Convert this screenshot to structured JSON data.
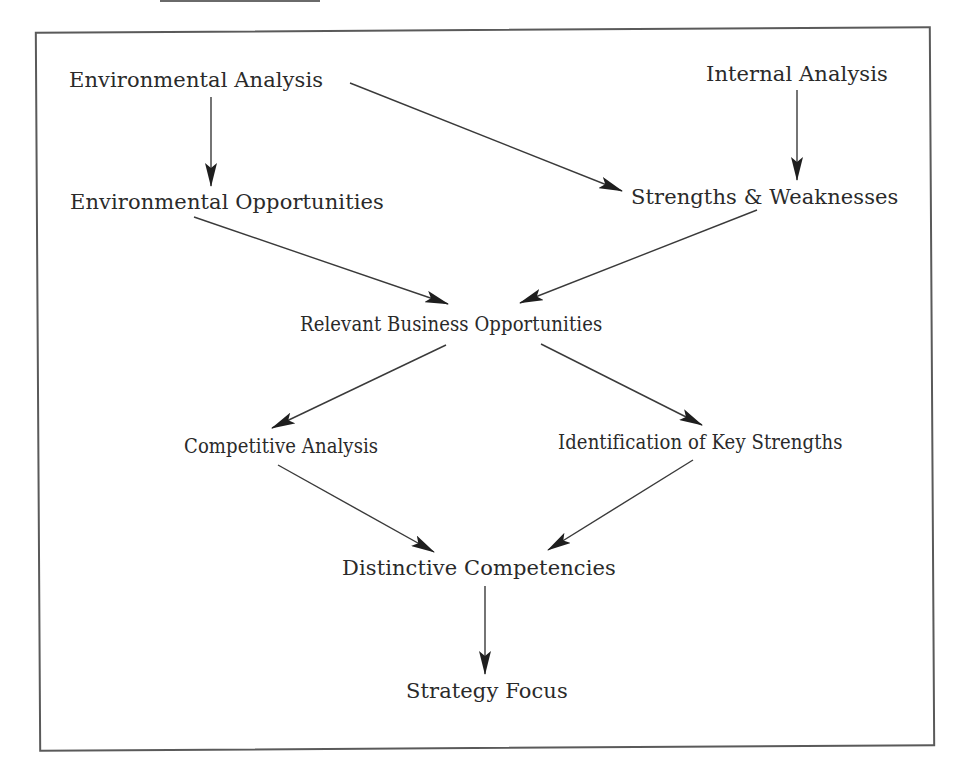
{
  "diagram": {
    "type": "flowchart",
    "colors": {
      "line": "#3a3a3a",
      "arrowhead": "#1e1e1e",
      "text": "#2a2a2a",
      "frame": "#5a5a5a",
      "background": "#ffffff"
    },
    "nodes": [
      {
        "id": "env_analysis",
        "label": "Environmental Analysis"
      },
      {
        "id": "internal_analysis",
        "label": "Internal Analysis"
      },
      {
        "id": "env_opportunities",
        "label": "Environmental Opportunities"
      },
      {
        "id": "strengths_weaknesses",
        "label": "Strengths & Weaknesses"
      },
      {
        "id": "relevant_business_opps",
        "label": "Relevant Business Opportunities"
      },
      {
        "id": "competitive_analysis",
        "label": "Competitive Analysis"
      },
      {
        "id": "key_strengths",
        "label": "Identification of Key Strengths"
      },
      {
        "id": "distinctive_competencies",
        "label": "Distinctive Competencies"
      },
      {
        "id": "strategy_focus",
        "label": "Strategy Focus"
      }
    ],
    "edges": [
      {
        "from": "env_analysis",
        "to": "env_opportunities"
      },
      {
        "from": "env_analysis",
        "to": "strengths_weaknesses"
      },
      {
        "from": "internal_analysis",
        "to": "strengths_weaknesses"
      },
      {
        "from": "env_opportunities",
        "to": "relevant_business_opps"
      },
      {
        "from": "strengths_weaknesses",
        "to": "relevant_business_opps"
      },
      {
        "from": "relevant_business_opps",
        "to": "competitive_analysis"
      },
      {
        "from": "relevant_business_opps",
        "to": "key_strengths"
      },
      {
        "from": "competitive_analysis",
        "to": "distinctive_competencies"
      },
      {
        "from": "key_strengths",
        "to": "distinctive_competencies"
      },
      {
        "from": "distinctive_competencies",
        "to": "strategy_focus"
      }
    ]
  }
}
